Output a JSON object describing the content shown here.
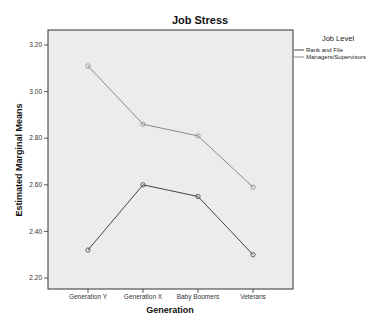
{
  "chart_data": {
    "type": "line",
    "title": "Job Stress",
    "xlabel": "Generation",
    "ylabel": "Estimated Marginal Means",
    "categories": [
      "Generation Y",
      "Generation X",
      "Baby Boomers",
      "Veterans"
    ],
    "yticks": [
      "2.20",
      "2.40",
      "2.60",
      "2.80",
      "3.00",
      "3.20"
    ],
    "ylim": [
      2.16,
      3.27
    ],
    "grid": false,
    "legend": {
      "title": "Job Level",
      "position": "right"
    },
    "series": [
      {
        "name": "Rank and File",
        "values": [
          2.32,
          2.6,
          2.55,
          2.3
        ],
        "color": "#444444"
      },
      {
        "name": "Managers/Supervisors",
        "values": [
          3.11,
          2.86,
          2.81,
          2.59
        ],
        "color": "#8a8a8a"
      }
    ]
  },
  "colors": {
    "plot_background": "#ececec",
    "frame": "#333333"
  }
}
